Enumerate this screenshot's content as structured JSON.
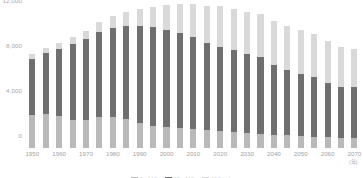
{
  "chart_data": {
    "type": "bar",
    "stacked": true,
    "title": "",
    "subtitle": "",
    "xlabel": "(年)",
    "ylabel": "",
    "ylim": [
      0,
      12000
    ],
    "yticks": [
      "0",
      "4,000",
      "8,000",
      "12,000"
    ],
    "ytick_values": [
      0,
      4000,
      8000,
      12000
    ],
    "grid": false,
    "legend_position": "bottom",
    "unit_note": "(年)",
    "categories": [
      "1950",
      "1955",
      "1960",
      "1965",
      "1970",
      "1975",
      "1980",
      "1985",
      "1990",
      "1995",
      "2000",
      "2005",
      "2010",
      "2015",
      "2020",
      "2025",
      "2030",
      "2035",
      "2040",
      "2045",
      "2050",
      "2055",
      "2060",
      "2065",
      "2070"
    ],
    "tick_labels": [
      "1950",
      "",
      "1960",
      "",
      "1970",
      "",
      "1980",
      "",
      "1990",
      "",
      "2000",
      "",
      "2010",
      "",
      "2020",
      "",
      "2030",
      "",
      "2040",
      "",
      "2050",
      "",
      "2060",
      "",
      "2070"
    ],
    "series": [
      {
        "name": "0〜14歳",
        "color": "#b9b9b9",
        "values": [
          2943,
          2980,
          2807,
          2517,
          2515,
          2722,
          2751,
          2603,
          2249,
          2001,
          1847,
          1752,
          1680,
          1589,
          1503,
          1407,
          1321,
          1246,
          1194,
          1138,
          1077,
          1012,
          951,
          898,
          859
        ]
      },
      {
        "name": "15〜64歳",
        "color": "#6f6f6f",
        "values": [
          4966,
          5473,
          5970,
          6693,
          7157,
          7581,
          7883,
          8251,
          8590,
          8716,
          8638,
          8442,
          8173,
          7728,
          7509,
          7310,
          7076,
          6875,
          6213,
          5787,
          5540,
          5275,
          4793,
          4529,
          4535
        ]
      },
      {
        "name": "65歳以上",
        "color": "#d9d9d9",
        "values": [
          411,
          475,
          535,
          618,
          733,
          887,
          1065,
          1247,
          1489,
          1828,
          2204,
          2576,
          2948,
          3347,
          3603,
          3653,
          3716,
          3782,
          3921,
          3954,
          3887,
          3822,
          3733,
          3588,
          3367
        ]
      }
    ],
    "totals": [
      8320,
      8928,
      9312,
      9828,
      10405,
      11190,
      11699,
      12101,
      12328,
      12545,
      12689,
      12770,
      12801,
      12664,
      12615,
      12370,
      12113,
      11903,
      11328,
      10879,
      10504,
      10109,
      9477,
      9015,
      8761
    ]
  },
  "legend": {
    "items": [
      {
        "label": "0〜14歳",
        "color": "#b9b9b9"
      },
      {
        "label": "15〜64歳",
        "color": "#6f6f6f"
      },
      {
        "label": "65歳以上",
        "color": "#d9d9d9"
      }
    ]
  },
  "axis": {
    "unit_label": "(年)"
  }
}
